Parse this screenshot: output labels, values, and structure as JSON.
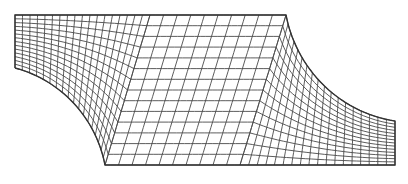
{
  "figure": {
    "colors": {
      "line": "#4a4a4a",
      "boundary": "#333333",
      "background": "#ffffff"
    }
  },
  "geometry": {
    "top_left": [
      15,
      15
    ],
    "left_bottom": [
      15,
      68
    ],
    "top_right_end": [
      286,
      15
    ],
    "bottom_left_end": [
      105,
      165
    ],
    "bottom_right": [
      395,
      165
    ],
    "right_top": [
      395,
      121
    ]
  },
  "blocks": [
    {
      "name": "left-block",
      "corners": {
        "a": [
          15,
          15
        ],
        "b": [
          150,
          15
        ],
        "c": [
          105,
          165
        ],
        "d": [
          15,
          68
        ]
      },
      "arc_edge": "bottom-left",
      "nu": 18,
      "nv": 14
    },
    {
      "name": "middle-block",
      "corners": {
        "a": [
          150,
          15
        ],
        "b": [
          286,
          15
        ],
        "c": [
          240,
          165
        ],
        "d": [
          105,
          165
        ]
      },
      "nu": 10,
      "nv": 14
    },
    {
      "name": "right-block",
      "corners": {
        "a": [
          286,
          15
        ],
        "b": [
          395,
          121
        ],
        "c": [
          395,
          165
        ],
        "d": [
          240,
          165
        ]
      },
      "arc_edge": "top-right",
      "nu": 18,
      "nv": 14
    }
  ]
}
